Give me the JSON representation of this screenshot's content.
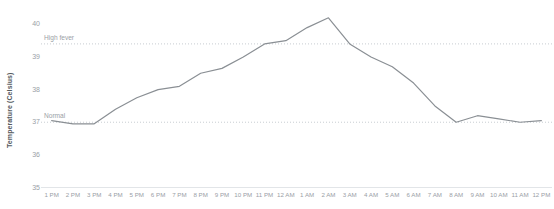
{
  "chart_data": {
    "type": "line",
    "title": "",
    "xlabel": "",
    "ylabel": "Temperature (Celsius)",
    "ylim": [
      35,
      40.5
    ],
    "grid": false,
    "legend": "none",
    "line_color": "#8a8f94",
    "x": [
      "1 PM",
      "2 PM",
      "3 PM",
      "4 PM",
      "5 PM",
      "6 PM",
      "7 PM",
      "8 PM",
      "9 PM",
      "10 PM",
      "11 PM",
      "12 AM",
      "1 AM",
      "2 AM",
      "3 AM",
      "4 AM",
      "5 AM",
      "6 AM",
      "7 AM",
      "8 AM",
      "9 AM",
      "10 AM",
      "11 AM",
      "12 PM"
    ],
    "categories": [
      "1 PM",
      "2 PM",
      "3 PM",
      "4 PM",
      "5 PM",
      "6 PM",
      "7 PM",
      "8 PM",
      "9 PM",
      "10 PM",
      "11 PM",
      "12 AM",
      "1 AM",
      "2 AM",
      "3 AM",
      "4 AM",
      "5 AM",
      "6 AM",
      "7 AM",
      "8 AM",
      "9 AM",
      "10 AM",
      "11 AM",
      "12 PM"
    ],
    "values": [
      37.05,
      36.95,
      36.95,
      37.4,
      37.75,
      38.0,
      38.1,
      38.5,
      38.65,
      39.0,
      39.4,
      39.5,
      39.9,
      40.2,
      39.4,
      39.0,
      38.7,
      38.2,
      37.5,
      37.0,
      37.2,
      37.1,
      37.0,
      37.05
    ],
    "ytick_labels": [
      "40",
      "39",
      "38",
      "37",
      "36",
      "35"
    ],
    "ytick_values": [
      40,
      39,
      38,
      37,
      36,
      35
    ],
    "reference_lines": [
      {
        "label": "High fever",
        "value": 39.4,
        "style": "dotted",
        "color": "#c8cdd2"
      },
      {
        "label": "Normal",
        "value": 37.0,
        "style": "dotted",
        "color": "#c8cdd2"
      }
    ]
  }
}
